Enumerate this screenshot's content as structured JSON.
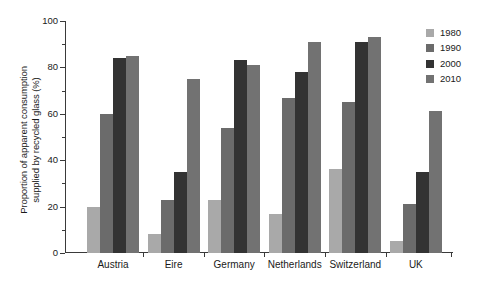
{
  "chart_data": {
    "type": "bar",
    "title": "",
    "subtitle": "",
    "xlabel": "",
    "ylabel": "Proportion of apparent consumption\nsupplied by recycled glass (%)",
    "categories": [
      "Austria",
      "Eire",
      "Germany",
      "Netherlands",
      "Switzerland",
      "UK"
    ],
    "series": [
      {
        "name": "1980",
        "color": "#a9a9a9",
        "values": [
          20,
          8,
          23,
          17,
          36,
          5
        ]
      },
      {
        "name": "1990",
        "color": "#6b6b6b",
        "values": [
          60,
          23,
          54,
          67,
          65,
          21
        ]
      },
      {
        "name": "2000",
        "color": "#333333",
        "values": [
          84,
          35,
          83,
          78,
          91,
          35
        ]
      },
      {
        "name": "2010",
        "color": "#727272",
        "values": [
          85,
          75,
          81,
          91,
          93,
          61
        ]
      }
    ],
    "ylim": [
      0,
      100
    ],
    "ytick_labels": [
      "0",
      "20",
      "40",
      "60",
      "80",
      "100"
    ],
    "ytick_values": [
      0,
      20,
      40,
      60,
      80,
      100
    ],
    "yminor_values": [
      10,
      30,
      50,
      70,
      90
    ],
    "grid": false,
    "legend_position": "top-right",
    "legend_entries": [
      "1980",
      "1990",
      "2000",
      "2010"
    ]
  }
}
